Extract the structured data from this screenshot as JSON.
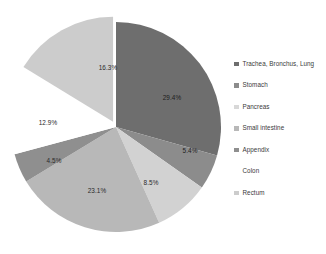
{
  "chart_data": {
    "type": "pie",
    "title": "",
    "subtitle": "",
    "xlabel": "",
    "ylabel": "",
    "grid": false,
    "legend_position": "right",
    "categories": [
      "Trachea, Bronchus, Lung",
      "Stomach",
      "Pancreas",
      "Small intestine",
      "Appendix",
      "Colon",
      "Rectum"
    ],
    "values": [
      29.4,
      5.4,
      8.5,
      23.1,
      4.5,
      12.9,
      16.3
    ],
    "value_labels": [
      "29.4%",
      "5.4%",
      "8.5%",
      "23.1%",
      "4.5%",
      "12.9%",
      "16.3%"
    ],
    "colors": [
      "#6e6e6e",
      "#8c8c8c",
      "#d2d2d2",
      "#b8b8b8",
      "#8f8f8f",
      "#ffffff",
      "#cccccc"
    ],
    "exploded_slice": "Colon",
    "start_angle_deg": 0,
    "direction": "clockwise"
  },
  "legend": {
    "items": [
      {
        "label": "Trachea, Bronchus, Lung",
        "color": "#6e6e6e"
      },
      {
        "label": "Stomach",
        "color": "#8c8c8c"
      },
      {
        "label": "Pancreas",
        "color": "#d8d8d8"
      },
      {
        "label": "Small intestine",
        "color": "#b8b8b8"
      },
      {
        "label": "Appendix",
        "color": "#8f8f8f"
      },
      {
        "label": "Colon",
        "color": "#ffffff"
      },
      {
        "label": "Rectum",
        "color": "#cccccc"
      }
    ]
  },
  "labels": {
    "lung": "29.4%",
    "stomach": "5.4%",
    "pancreas": "8.5%",
    "small_intestine": "23.1%",
    "appendix": "4.5%",
    "colon": "12.9%",
    "rectum": "16.3%"
  }
}
